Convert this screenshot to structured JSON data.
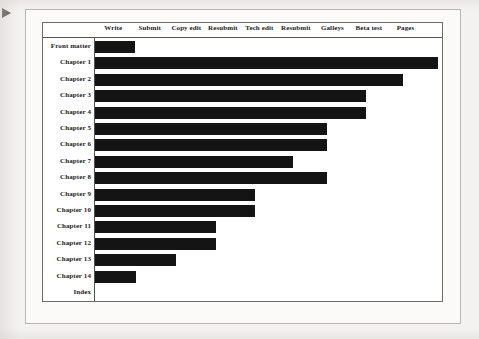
{
  "figure": {
    "pointer_icon": "right-arrow-marker",
    "columns": [
      "Write",
      "Submit",
      "Copy edit",
      "Resubmit",
      "Tech edit",
      "Resubmit",
      "Galleys",
      "Beta test",
      "Pages"
    ],
    "rows": [
      "Front matter",
      "Chapter 1",
      "Chapter 2",
      "Chapter 3",
      "Chapter 4",
      "Chapter 5",
      "Chapter 6",
      "Chapter 7",
      "Chapter 8",
      "Chapter 9",
      "Chapter 10",
      "Chapter 11",
      "Chapter 12",
      "Chapter 13",
      "Chapter 14",
      "Index"
    ],
    "bar_color": "#141414",
    "frame_color": "#55524e",
    "page_color": "#f4f2f0"
  },
  "chart_data": {
    "type": "bar",
    "title": "",
    "xlabel": "",
    "ylabel": "",
    "orientation": "horizontal",
    "grid": false,
    "legend": null,
    "note": "Gantt-style progress chart: each row's bar starts at the Write phase and extends through the last completed production stage.",
    "x_axis": {
      "kind": "categorical-stages",
      "tick_labels": [
        "Write",
        "Submit",
        "Copy edit",
        "Resubmit",
        "Tech edit",
        "Resubmit",
        "Galleys",
        "Beta test",
        "Pages"
      ],
      "tick_positions": [
        1,
        2,
        3,
        4,
        5,
        6,
        7,
        8,
        9
      ],
      "range": [
        0,
        9.5
      ]
    },
    "categories": [
      "Front matter",
      "Chapter 1",
      "Chapter 2",
      "Chapter 3",
      "Chapter 4",
      "Chapter 5",
      "Chapter 6",
      "Chapter 7",
      "Chapter 8",
      "Chapter 9",
      "Chapter 10",
      "Chapter 11",
      "Chapter 12",
      "Chapter 13",
      "Chapter 14",
      "Index"
    ],
    "values": [
      1.2,
      9.4,
      8.5,
      7.6,
      7.6,
      6.6,
      6.6,
      5.7,
      6.6,
      4.5,
      4.5,
      3.5,
      3.5,
      2.4,
      1.4,
      0
    ],
    "value_unit": "stages completed",
    "bar_end_stage": [
      "Write",
      "Pages",
      "Beta test",
      "Galleys",
      "Galleys",
      "Resubmit",
      "Resubmit",
      "Tech edit",
      "Resubmit",
      "Resubmit",
      "Resubmit",
      "Copy edit",
      "Copy edit",
      "Submit",
      "Write",
      "none"
    ],
    "bar_pixel_widths": [
      40,
      343,
      308,
      271,
      271,
      232,
      232,
      198,
      232,
      160,
      160,
      121,
      121,
      81,
      41,
      0
    ]
  }
}
